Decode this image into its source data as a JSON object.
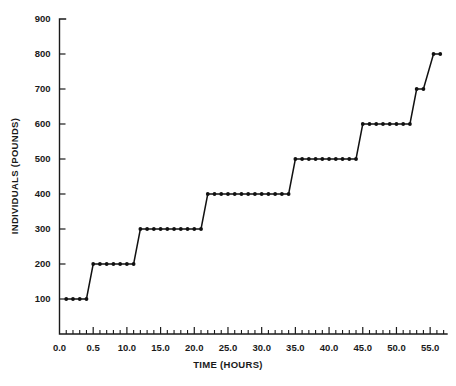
{
  "figure": {
    "caption": "",
    "background_color": "#ffffff",
    "ink_color": "#111111"
  },
  "chart_data": {
    "type": "line",
    "subtype": "step",
    "title": "",
    "subtitle": "",
    "xlabel": "TIME (HOURS)",
    "ylabel": "INDIVIDUALS (POUNDS)",
    "xlim": [
      0.0,
      57.5
    ],
    "ylim": [
      0,
      900
    ],
    "grid": false,
    "legend": null,
    "legend_position": "none",
    "x_tick_labels": [
      "0.0",
      "0.5",
      "10.0",
      "15.0",
      "20.0",
      "25.0",
      "30.0",
      "35.0",
      "40.0",
      "45.0",
      "50.0",
      "55.0"
    ],
    "x_tick_values": [
      0,
      5,
      10,
      15,
      20,
      25,
      30,
      35,
      40,
      45,
      50,
      55
    ],
    "x_minor_tick_interval": 1,
    "y_tick_labels": [
      "100",
      "200",
      "300",
      "400",
      "500",
      "600",
      "700",
      "800",
      "900"
    ],
    "y_tick_values": [
      100,
      200,
      300,
      400,
      500,
      600,
      700,
      800,
      900
    ],
    "y_minor_ticks": false,
    "marker": "filled-circle",
    "series": [
      {
        "name": "individuals",
        "points": [
          {
            "x": 1.0,
            "y": 100
          },
          {
            "x": 2.0,
            "y": 100
          },
          {
            "x": 3.0,
            "y": 100
          },
          {
            "x": 4.0,
            "y": 100
          },
          {
            "x": 5.0,
            "y": 200
          },
          {
            "x": 6.0,
            "y": 200
          },
          {
            "x": 7.0,
            "y": 200
          },
          {
            "x": 8.0,
            "y": 200
          },
          {
            "x": 9.0,
            "y": 200
          },
          {
            "x": 10.0,
            "y": 200
          },
          {
            "x": 11.0,
            "y": 200
          },
          {
            "x": 12.0,
            "y": 300
          },
          {
            "x": 13.0,
            "y": 300
          },
          {
            "x": 14.0,
            "y": 300
          },
          {
            "x": 15.0,
            "y": 300
          },
          {
            "x": 16.0,
            "y": 300
          },
          {
            "x": 17.0,
            "y": 300
          },
          {
            "x": 18.0,
            "y": 300
          },
          {
            "x": 19.0,
            "y": 300
          },
          {
            "x": 20.0,
            "y": 300
          },
          {
            "x": 21.0,
            "y": 300
          },
          {
            "x": 22.0,
            "y": 400
          },
          {
            "x": 23.0,
            "y": 400
          },
          {
            "x": 24.0,
            "y": 400
          },
          {
            "x": 25.0,
            "y": 400
          },
          {
            "x": 26.0,
            "y": 400
          },
          {
            "x": 27.0,
            "y": 400
          },
          {
            "x": 28.0,
            "y": 400
          },
          {
            "x": 29.0,
            "y": 400
          },
          {
            "x": 30.0,
            "y": 400
          },
          {
            "x": 31.0,
            "y": 400
          },
          {
            "x": 32.0,
            "y": 400
          },
          {
            "x": 33.0,
            "y": 400
          },
          {
            "x": 34.0,
            "y": 400
          },
          {
            "x": 35.0,
            "y": 500
          },
          {
            "x": 36.0,
            "y": 500
          },
          {
            "x": 37.0,
            "y": 500
          },
          {
            "x": 38.0,
            "y": 500
          },
          {
            "x": 39.0,
            "y": 500
          },
          {
            "x": 40.0,
            "y": 500
          },
          {
            "x": 41.0,
            "y": 500
          },
          {
            "x": 42.0,
            "y": 500
          },
          {
            "x": 43.0,
            "y": 500
          },
          {
            "x": 44.0,
            "y": 500
          },
          {
            "x": 45.0,
            "y": 600
          },
          {
            "x": 46.0,
            "y": 600
          },
          {
            "x": 47.0,
            "y": 600
          },
          {
            "x": 48.0,
            "y": 600
          },
          {
            "x": 49.0,
            "y": 600
          },
          {
            "x": 50.0,
            "y": 600
          },
          {
            "x": 51.0,
            "y": 600
          },
          {
            "x": 52.0,
            "y": 600
          },
          {
            "x": 53.0,
            "y": 700
          },
          {
            "x": 54.0,
            "y": 700
          },
          {
            "x": 55.5,
            "y": 800
          },
          {
            "x": 56.5,
            "y": 800
          }
        ]
      }
    ]
  }
}
